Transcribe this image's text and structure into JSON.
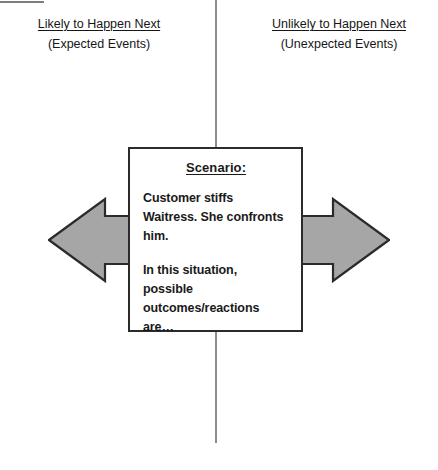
{
  "diagram": {
    "columns": [
      {
        "id": "likely",
        "title": "Likely to Happen Next",
        "subtitle": "(Expected Events)",
        "arrow_icon": "arrow-left-icon",
        "arrow_direction": "left"
      },
      {
        "id": "unlikely",
        "title": "Unlikely to Happen Next",
        "subtitle": "(Unexpected Events)",
        "arrow_icon": "arrow-right-icon",
        "arrow_direction": "right"
      }
    ],
    "scenario": {
      "heading": "Scenario:",
      "paragraph_1": "Customer stiffs Waitress. She confronts him.",
      "paragraph_2": "In this situation, possible outcomes/reactions are…"
    },
    "colors": {
      "arrow_fill": "#a6a6a6",
      "arrow_stroke": "#2b2b2b",
      "box_border": "#2b2b2b",
      "divider": "#8d8d8d",
      "text": "#161616",
      "background": "#ffffff"
    }
  }
}
